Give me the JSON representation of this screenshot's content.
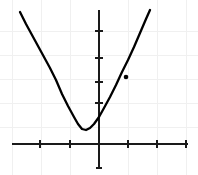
{
  "figure": {
    "width": 198,
    "height": 175,
    "background_color": "#ffffff"
  },
  "style": {
    "curve_color": "#000000",
    "axis_color": "#1a1a1a",
    "grid_color": "#f0f0f0",
    "point_color": "#000000"
  },
  "chart_data": {
    "type": "line",
    "title": "",
    "xlabel": "",
    "ylabel": "",
    "grid": true,
    "legend": null,
    "xlim": [
      -3,
      3
    ],
    "ylim": [
      -1.5,
      5.5
    ],
    "xticks": [
      -2,
      -1,
      1,
      2,
      3
    ],
    "yticks": [
      1,
      2,
      3,
      4
    ],
    "xtick_labels": [
      "",
      "",
      "",
      "",
      ""
    ],
    "ytick_labels": [
      "",
      "",
      "",
      ""
    ],
    "function": "y = 2(x + 0.6)^2 + 0.6",
    "vertex": [
      -0.6,
      0.6
    ],
    "series": [
      {
        "name": "parabola",
        "x": [
          -2.7,
          -2.4,
          -2.1,
          -1.8,
          -1.5,
          -1.2,
          -0.9,
          -0.6,
          -0.3,
          0.0,
          0.3,
          0.6,
          0.9,
          1.2,
          1.5,
          1.75
        ],
        "values": [
          9.42,
          7.08,
          5.1,
          3.48,
          2.22,
          1.32,
          0.78,
          0.6,
          0.78,
          1.32,
          2.22,
          3.48,
          5.1,
          7.08,
          9.42,
          11.64
        ]
      }
    ],
    "annotations": [
      {
        "name": "marked-point",
        "x": 0.93,
        "y": 2.8,
        "label": ""
      }
    ]
  },
  "geometry": {
    "origin": {
      "x": 99,
      "y": 144
    },
    "unit_x": 29,
    "unit_y": 24,
    "grid_vertical_x": [
      12,
      41,
      70,
      128,
      157,
      186
    ],
    "grid_horizontal_y": [
      31,
      55,
      79,
      103,
      127
    ],
    "x_axis": {
      "x1": 12,
      "x2": 188,
      "y": 144
    },
    "y_axis": {
      "x": 99,
      "y1": 10,
      "y2": 168
    },
    "x_tick_positions": [
      40,
      70,
      128,
      157,
      186
    ],
    "y_tick_positions": [
      31,
      58,
      82,
      103
    ],
    "y_axis_end_tick": 168,
    "curve_points": "20,12 26,24 32,35 38,46 44,57 50,68 56,80 62,94 68,106 74,117 78,124 82,129 86,130 90,128 94,124 99,117 104,108 110,97 116,85 122,72 128,60 134,47 140,33 146,19 150,10",
    "marker": {
      "cx": 126,
      "cy": 77,
      "r": 2.3
    }
  }
}
